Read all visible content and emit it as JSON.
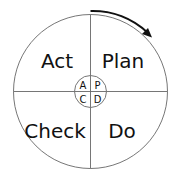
{
  "diagram": {
    "quadrants": {
      "top_left": "Act",
      "top_right": "Plan",
      "bottom_left": "Check",
      "bottom_right": "Do"
    },
    "center": {
      "top_left": "A",
      "top_right": "P",
      "bottom_left": "C",
      "bottom_right": "D"
    },
    "arrow_direction": "clockwise",
    "colors": {
      "stroke": "#555555",
      "arrow": "#111111",
      "text": "#111111",
      "background": "#ffffff"
    }
  }
}
